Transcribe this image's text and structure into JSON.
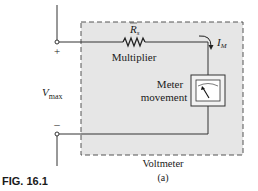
{
  "figure": {
    "caption": "FIG. 16.1",
    "sub_label": "(a)"
  },
  "circuit": {
    "box_label": "Voltmeter",
    "resistor": {
      "symbol": "R",
      "subscript": "s",
      "label": "Multiplier"
    },
    "meter": {
      "label_line1": "Meter",
      "label_line2": "movement"
    },
    "current": {
      "symbol": "I",
      "subscript": "M"
    },
    "voltage": {
      "symbol": "V",
      "subscript": "max"
    },
    "terminals": {
      "positive": "+",
      "negative": "–"
    }
  },
  "colors": {
    "box_fill": "#e6e6e6",
    "line": "#333333",
    "text": "#1a1a1a"
  }
}
